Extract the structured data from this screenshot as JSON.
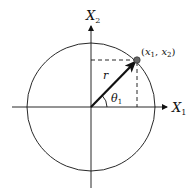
{
  "diagram": {
    "type": "polar-coordinate-diagram",
    "axes": {
      "horizontal": {
        "label": "X",
        "subscript": "1"
      },
      "vertical": {
        "label": "X",
        "subscript": "2"
      }
    },
    "point": {
      "label_open": "(",
      "var1": "x",
      "sub1": "1",
      "sep": ", ",
      "var2": "x",
      "sub2": "2",
      "label_close": ")"
    },
    "radius_label": "r",
    "angle_label": {
      "symbol": "θ",
      "subscript": "1"
    },
    "colors": {
      "line": "#111111",
      "point_fill": "#666666",
      "background": "#ffffff"
    }
  }
}
